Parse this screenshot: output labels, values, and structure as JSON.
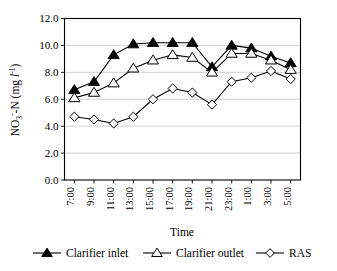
{
  "chart_data": {
    "type": "line",
    "title": "",
    "xlabel": "Time",
    "ylabel": "NO3-N (mg l-1)",
    "ylabel_parts": {
      "base": "NO",
      "subscript": "3",
      "superscript": "-",
      "tail": "-N (mg ",
      "italic": "l",
      "exponent": "-1",
      "close": ")"
    },
    "categories": [
      "7:00",
      "9:00",
      "11:00",
      "13:00",
      "15:00",
      "17:00",
      "19:00",
      "21:00",
      "23:00",
      "1:00",
      "3:00",
      "5:00"
    ],
    "ylim": [
      0.0,
      12.0
    ],
    "ytick_labels": [
      "0.0",
      "2.0",
      "4.0",
      "6.0",
      "8.0",
      "10.0",
      "12.0"
    ],
    "ytick_values": [
      0.0,
      2.0,
      4.0,
      6.0,
      8.0,
      10.0,
      12.0
    ],
    "grid": true,
    "grid_axis": "y",
    "legend_position": "bottom",
    "series": [
      {
        "name": "Clarifier inlet",
        "marker": "triangle-filled",
        "values": [
          6.7,
          7.3,
          9.3,
          10.1,
          10.2,
          10.2,
          10.2,
          8.4,
          10.0,
          9.8,
          9.2,
          8.7
        ]
      },
      {
        "name": "Clarifier outlet",
        "marker": "triangle-open",
        "values": [
          6.1,
          6.5,
          7.2,
          8.3,
          8.9,
          9.3,
          9.1,
          8.0,
          9.4,
          9.4,
          8.9,
          8.2
        ]
      },
      {
        "name": "RAS",
        "marker": "diamond-open",
        "values": [
          4.7,
          4.5,
          4.2,
          4.7,
          6.0,
          6.8,
          6.5,
          5.6,
          7.3,
          7.6,
          8.1,
          7.5
        ]
      }
    ]
  },
  "legend": {
    "items": [
      {
        "label": "Clarifier inlet",
        "marker": "triangle-filled"
      },
      {
        "label": "Clarifier outlet",
        "marker": "triangle-open"
      },
      {
        "label": "RAS",
        "marker": "diamond-open"
      }
    ]
  },
  "colors": {
    "ink": "#000000",
    "grid": "#bfbfbf",
    "background": "#ffffff"
  }
}
